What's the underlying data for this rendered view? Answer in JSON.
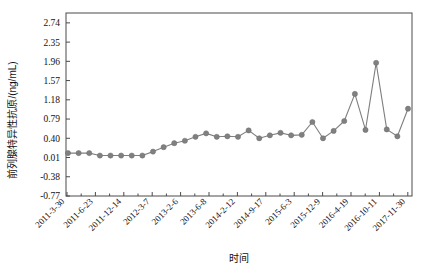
{
  "chart_data": {
    "type": "line",
    "title": "",
    "xlabel": "时间",
    "ylabel": "前列腺特异性抗原/(ng/mL)",
    "ylim": [
      -0.77,
      2.94
    ],
    "yticks": [
      -0.77,
      -0.38,
      0.01,
      0.4,
      0.79,
      1.18,
      1.57,
      1.96,
      2.35,
      2.74
    ],
    "ytick_labels": [
      "-0.77",
      "-0.38",
      "0.01",
      "0.40",
      "0.79",
      "1.18",
      "1.57",
      "1.96",
      "2.35",
      "2.74"
    ],
    "xtick_labels": [
      "2011-3-30",
      "2011-6-23",
      "2011-12-14",
      "2012-3-7",
      "2013-2-6",
      "2013-6-8",
      "2014-2-12",
      "2014-9-17",
      "2015-6-3",
      "2015-12-9",
      "2016-4-19",
      "2016-10-11",
      "2017-11-30"
    ],
    "grid": false,
    "legend": "none",
    "marker": "circle",
    "series_color": "#808080",
    "x": [
      0,
      1,
      2,
      3,
      4,
      5,
      6,
      7,
      8,
      9,
      10,
      11,
      12,
      13,
      14,
      15,
      16,
      17,
      18,
      19,
      20,
      21,
      22,
      23,
      24,
      25,
      26,
      27,
      28,
      29,
      30
    ],
    "values": [
      0.1,
      0.1,
      0.1,
      0.05,
      0.05,
      0.05,
      0.05,
      0.05,
      0.13,
      0.22,
      0.3,
      0.35,
      0.43,
      0.5,
      0.43,
      0.44,
      0.43,
      0.56,
      0.4,
      0.46,
      0.51,
      0.46,
      0.47,
      0.73,
      0.4,
      0.55,
      0.75,
      1.3,
      0.57,
      1.93,
      0.58
    ],
    "values_tail": [
      0.44,
      1.0
    ],
    "n_points": 33
  }
}
